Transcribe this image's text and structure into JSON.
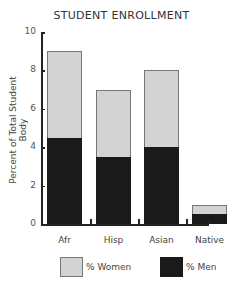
{
  "chart_data": {
    "type": "bar",
    "stacked": true,
    "title": "STUDENT ENROLLMENT",
    "xlabel": "",
    "ylabel": "Percent of Total Student Body",
    "ylim": [
      0,
      10
    ],
    "yticks": [
      "0",
      "2",
      "4",
      "6",
      "8",
      "10"
    ],
    "categories": [
      "Afr",
      "Hisp",
      "Asian",
      "Native"
    ],
    "series": [
      {
        "name": "% Men",
        "color": "#1a1a1a",
        "values": [
          4.5,
          3.5,
          4.0,
          0.5
        ]
      },
      {
        "name": "% Women",
        "color": "#d3d3d3",
        "values": [
          4.5,
          3.5,
          4.0,
          0.5
        ]
      }
    ],
    "totals": [
      9.0,
      7.0,
      8.0,
      1.0
    ],
    "grid": false,
    "legend_position": "bottom"
  },
  "legend": {
    "women_label": "% Women",
    "men_label": "% Men"
  }
}
